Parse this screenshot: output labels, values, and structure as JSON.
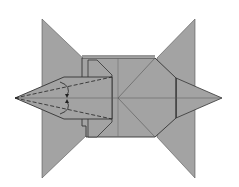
{
  "diagram": {
    "fill": "#a3a3a3",
    "stroke": "#333333",
    "background": "#ffffff",
    "annotations": [
      "valley-fold-top",
      "valley-fold-bottom",
      "fold-arrow-top",
      "fold-arrow-bottom"
    ]
  }
}
